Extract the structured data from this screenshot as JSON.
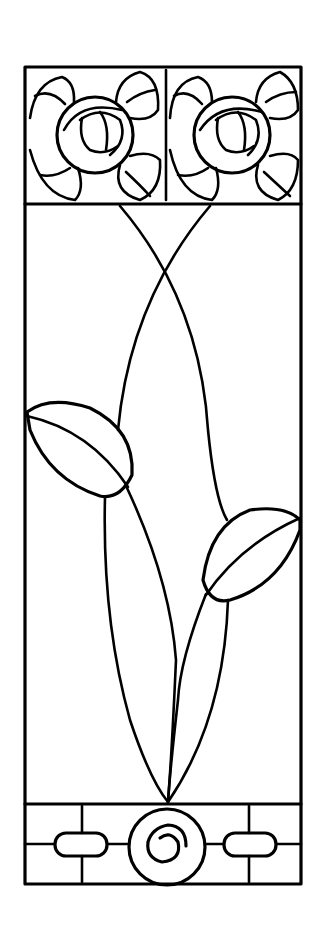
{
  "artwork": {
    "title": "Stained glass panel pattern",
    "description": "Line drawing of a tall stained glass panel with two stylized roses at top, two crossing stems with leaves, and a spiral medallion base",
    "colors": {
      "line": "#000000",
      "background": "#ffffff"
    },
    "sections": [
      "rose-header",
      "stem-field",
      "spiral-base"
    ]
  }
}
